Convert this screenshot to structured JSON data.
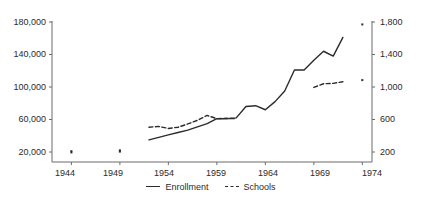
{
  "chart_data": {
    "type": "line",
    "title": "",
    "subtitle": "",
    "xlabel": "",
    "ylabel": "",
    "y2label": "",
    "grid": false,
    "legend_position": "bottom-center",
    "x": [
      1944,
      1949,
      1952,
      1953,
      1954,
      1955,
      1956,
      1957,
      1958,
      1959,
      1960,
      1961,
      1962,
      1963,
      1964,
      1965,
      1966,
      1967,
      1968,
      1969,
      1970,
      1971,
      1972,
      1974
    ],
    "xlim": [
      1942,
      1975
    ],
    "xticks": [
      1944,
      1949,
      1954,
      1959,
      1964,
      1969,
      1974
    ],
    "xticklabels": [
      "1944",
      "1949",
      "1954",
      "1959",
      "1964",
      "1969",
      "1974"
    ],
    "ylim": [
      0,
      180000
    ],
    "yticks": [
      20000,
      60000,
      100000,
      140000,
      180000
    ],
    "yticklabels": [
      "20,000",
      "60,000",
      "100,000",
      "140,000",
      "180,000"
    ],
    "y2lim": [
      0,
      1800
    ],
    "y2ticks": [
      200,
      600,
      1000,
      1400,
      1800
    ],
    "y2ticklabels": [
      "200",
      "600",
      "1,000",
      "1,400",
      "1,800"
    ],
    "series": [
      {
        "name": "Enrollment",
        "axis": "left",
        "style": "solid",
        "color": "#2b2b2b",
        "points": [
          {
            "x": 1952,
            "y": 35000
          },
          {
            "x": 1953,
            "y": 38000
          },
          {
            "x": 1954,
            "y": 41000
          },
          {
            "x": 1955,
            "y": 44000
          },
          {
            "x": 1956,
            "y": 47000
          },
          {
            "x": 1957,
            "y": 51000
          },
          {
            "x": 1958,
            "y": 55000
          },
          {
            "x": 1959,
            "y": 61000
          },
          {
            "x": 1960,
            "y": 61000
          },
          {
            "x": 1961,
            "y": 62000
          },
          {
            "x": 1962,
            "y": 76000
          },
          {
            "x": 1963,
            "y": 77000
          },
          {
            "x": 1964,
            "y": 72000
          },
          {
            "x": 1965,
            "y": 82000
          },
          {
            "x": 1966,
            "y": 95000
          },
          {
            "x": 1967,
            "y": 121000
          },
          {
            "x": 1968,
            "y": 121000
          },
          {
            "x": 1969,
            "y": 133000
          },
          {
            "x": 1970,
            "y": 144000
          },
          {
            "x": 1971,
            "y": 138000
          },
          {
            "x": 1972,
            "y": 161000
          }
        ],
        "markers": [
          {
            "x": 1944,
            "y": 21000
          },
          {
            "x": 1949,
            "y": 22000
          },
          {
            "x": 1974,
            "y": 177000
          }
        ]
      },
      {
        "name": "Schools",
        "axis": "right",
        "style": "dashed",
        "color": "#2b2b2b",
        "points": [
          {
            "x": 1952,
            "y": 505
          },
          {
            "x": 1953,
            "y": 515
          },
          {
            "x": 1954,
            "y": 490
          },
          {
            "x": 1955,
            "y": 505
          },
          {
            "x": 1956,
            "y": 545
          },
          {
            "x": 1957,
            "y": 590
          },
          {
            "x": 1958,
            "y": 650
          },
          {
            "x": 1959,
            "y": 610
          },
          {
            "x": 1960,
            "y": 615
          },
          {
            "x": 1961,
            "y": 610
          }
        ],
        "points2": [
          {
            "x": 1969,
            "y": 995
          },
          {
            "x": 1970,
            "y": 1040
          },
          {
            "x": 1971,
            "y": 1045
          },
          {
            "x": 1972,
            "y": 1065
          }
        ],
        "markers": [
          {
            "x": 1944,
            "y": 195
          },
          {
            "x": 1949,
            "y": 205
          },
          {
            "x": 1974,
            "y": 1085
          }
        ]
      }
    ]
  },
  "legend": {
    "items": [
      {
        "label": "Enrollment",
        "style": "solid"
      },
      {
        "label": "Schools",
        "style": "dashed"
      }
    ]
  },
  "axes": {
    "left": {
      "ticks": [
        "180,000",
        "140,000",
        "100,000",
        "60,000",
        "20,000"
      ]
    },
    "right": {
      "ticks": [
        "1,800",
        "1,400",
        "1,000",
        "600",
        "200"
      ]
    },
    "bottom": {
      "ticks": [
        "1944",
        "1949",
        "1954",
        "1959",
        "1964",
        "1969",
        "1974"
      ]
    }
  }
}
